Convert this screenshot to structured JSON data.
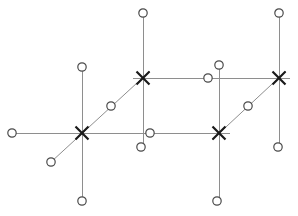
{
  "diagram": {
    "canvas": {
      "width": 298,
      "height": 216,
      "background": "#ffffff"
    },
    "style": {
      "line_color": "#8e8e8e",
      "circle_stroke": "#4a4a4a",
      "circle_fill": "#ffffff",
      "cross_color": "#1a1a1a",
      "line_width": 1,
      "cross_width": 2.2,
      "circle_radius": 4.2,
      "cross_arm": 6.5
    },
    "crosses": [
      {
        "id": "cross-left",
        "label": "X1",
        "x": 82,
        "y": 133
      },
      {
        "id": "cross-upper-mid",
        "label": "X2",
        "x": 143,
        "y": 78
      },
      {
        "id": "cross-lower-mid",
        "label": "X3",
        "x": 219,
        "y": 133
      },
      {
        "id": "cross-upper-right",
        "label": "X4",
        "x": 279,
        "y": 78
      }
    ],
    "circles": [
      {
        "id": "circle-far-left",
        "x": 12,
        "y": 133
      },
      {
        "id": "circle-above-left-cross",
        "x": 82,
        "y": 67
      },
      {
        "id": "circle-below-left-cross",
        "x": 82,
        "y": 201
      },
      {
        "id": "circle-lower-left-diagonal",
        "x": 51,
        "y": 162
      },
      {
        "id": "circle-upper-left-diagonal",
        "x": 111,
        "y": 106
      },
      {
        "id": "circle-top-mid",
        "x": 143,
        "y": 13
      },
      {
        "id": "circle-mid-horizontal",
        "x": 150,
        "y": 133
      },
      {
        "id": "circle-mid-vertical-end",
        "x": 141,
        "y": 147
      },
      {
        "id": "circle-above-lower-mid-cross",
        "x": 219,
        "y": 65
      },
      {
        "id": "circle-upper-horizontal-mid",
        "x": 208,
        "y": 78
      },
      {
        "id": "circle-below-lower-mid-cross",
        "x": 217,
        "y": 201
      },
      {
        "id": "circle-right-diagonal",
        "x": 248,
        "y": 106
      },
      {
        "id": "circle-top-right",
        "x": 279,
        "y": 13
      },
      {
        "id": "circle-right-lower-end",
        "x": 278,
        "y": 147
      }
    ],
    "edges": [
      {
        "id": "edge-lower-horizontal",
        "kind": "horizontal",
        "x1": 12,
        "y1": 133,
        "x2": 230,
        "y2": 133
      },
      {
        "id": "edge-upper-horizontal",
        "kind": "horizontal",
        "x1": 133,
        "y1": 78,
        "x2": 290,
        "y2": 78
      },
      {
        "id": "edge-vertical-left",
        "kind": "vertical",
        "x1": 82,
        "y1": 67,
        "x2": 82,
        "y2": 201
      },
      {
        "id": "edge-vertical-upper-mid",
        "kind": "vertical",
        "x1": 143,
        "y1": 13,
        "x2": 143,
        "y2": 147
      },
      {
        "id": "edge-vertical-lower-mid",
        "kind": "vertical",
        "x1": 219,
        "y1": 65,
        "x2": 219,
        "y2": 201
      },
      {
        "id": "edge-vertical-right",
        "kind": "vertical",
        "x1": 279,
        "y1": 13,
        "x2": 279,
        "y2": 147
      },
      {
        "id": "edge-diagonal-left",
        "kind": "diagonal",
        "x1": 51,
        "y1": 162,
        "x2": 150,
        "y2": 71
      },
      {
        "id": "edge-diagonal-right",
        "kind": "diagonal",
        "x1": 212,
        "y1": 140,
        "x2": 286,
        "y2": 71
      }
    ]
  }
}
